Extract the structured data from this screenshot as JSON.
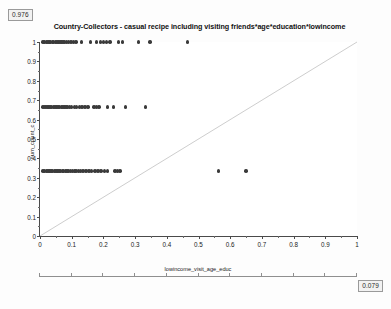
{
  "badges": {
    "top_left": "0.976",
    "bottom_right": "0.079"
  },
  "chart_data": {
    "type": "scatter",
    "title": "Country-Collectors - casual recipe including visiting friends*age*education*lowincome",
    "xlabel": "lowincome_visit_age_educ",
    "ylabel": "num_count_c",
    "xlim": [
      0,
      1
    ],
    "ylim": [
      0,
      1
    ],
    "grid": false,
    "legend": null,
    "xticks": [
      "0",
      "0.1",
      "0.2",
      "0.3",
      "0.4",
      "0.5",
      "0.6",
      "0.7",
      "0.8",
      "0.9",
      "1"
    ],
    "xtick_values": [
      0,
      0.1,
      0.2,
      0.3,
      0.4,
      0.5,
      0.6,
      0.7,
      0.8,
      0.9,
      1
    ],
    "yticks": [
      "1",
      "0.9",
      "0.8",
      "0.7",
      "0.6",
      "0.5",
      "0.4",
      "0.3",
      "0.2",
      "0.1",
      "0"
    ],
    "ytick_values": [
      1,
      0.9,
      0.8,
      0.7,
      0.6,
      0.5,
      0.4,
      0.3,
      0.2,
      0.1,
      0
    ],
    "marker": "filled-circle",
    "marker_color": "#3a3a3a",
    "reference_line": {
      "type": "diagonal",
      "from": [
        0,
        0
      ],
      "to": [
        1,
        1
      ],
      "color": "#4a4a4a"
    },
    "points": [
      [
        0.01,
        1.0
      ],
      [
        0.015,
        1.0
      ],
      [
        0.02,
        1.0
      ],
      [
        0.025,
        1.0
      ],
      [
        0.029,
        1.0
      ],
      [
        0.034,
        1.0
      ],
      [
        0.039,
        1.0
      ],
      [
        0.043,
        1.0
      ],
      [
        0.048,
        1.0
      ],
      [
        0.053,
        1.0
      ],
      [
        0.058,
        1.0
      ],
      [
        0.063,
        1.0
      ],
      [
        0.068,
        1.0
      ],
      [
        0.073,
        1.0
      ],
      [
        0.078,
        1.0
      ],
      [
        0.083,
        1.0
      ],
      [
        0.09,
        1.0
      ],
      [
        0.098,
        1.0
      ],
      [
        0.106,
        1.0
      ],
      [
        0.114,
        1.0
      ],
      [
        0.13,
        1.0
      ],
      [
        0.16,
        1.0
      ],
      [
        0.178,
        1.0
      ],
      [
        0.191,
        1.0
      ],
      [
        0.2,
        1.0
      ],
      [
        0.21,
        1.0
      ],
      [
        0.221,
        1.0
      ],
      [
        0.248,
        1.0
      ],
      [
        0.261,
        1.0
      ],
      [
        0.31,
        1.0
      ],
      [
        0.347,
        1.0
      ],
      [
        0.465,
        1.0
      ],
      [
        0.01,
        0.665
      ],
      [
        0.016,
        0.665
      ],
      [
        0.022,
        0.665
      ],
      [
        0.027,
        0.665
      ],
      [
        0.032,
        0.665
      ],
      [
        0.037,
        0.665
      ],
      [
        0.042,
        0.665
      ],
      [
        0.047,
        0.665
      ],
      [
        0.052,
        0.665
      ],
      [
        0.057,
        0.665
      ],
      [
        0.062,
        0.665
      ],
      [
        0.067,
        0.665
      ],
      [
        0.072,
        0.665
      ],
      [
        0.077,
        0.665
      ],
      [
        0.082,
        0.665
      ],
      [
        0.087,
        0.665
      ],
      [
        0.093,
        0.665
      ],
      [
        0.1,
        0.665
      ],
      [
        0.108,
        0.665
      ],
      [
        0.116,
        0.665
      ],
      [
        0.124,
        0.665
      ],
      [
        0.133,
        0.665
      ],
      [
        0.142,
        0.665
      ],
      [
        0.152,
        0.665
      ],
      [
        0.17,
        0.665
      ],
      [
        0.178,
        0.665
      ],
      [
        0.186,
        0.665
      ],
      [
        0.212,
        0.665
      ],
      [
        0.232,
        0.665
      ],
      [
        0.27,
        0.665
      ],
      [
        0.332,
        0.665
      ],
      [
        0.01,
        0.335
      ],
      [
        0.015,
        0.335
      ],
      [
        0.02,
        0.335
      ],
      [
        0.025,
        0.335
      ],
      [
        0.03,
        0.335
      ],
      [
        0.035,
        0.335
      ],
      [
        0.04,
        0.335
      ],
      [
        0.045,
        0.335
      ],
      [
        0.05,
        0.335
      ],
      [
        0.055,
        0.335
      ],
      [
        0.06,
        0.335
      ],
      [
        0.065,
        0.335
      ],
      [
        0.07,
        0.335
      ],
      [
        0.075,
        0.335
      ],
      [
        0.08,
        0.335
      ],
      [
        0.085,
        0.335
      ],
      [
        0.09,
        0.335
      ],
      [
        0.096,
        0.335
      ],
      [
        0.102,
        0.335
      ],
      [
        0.108,
        0.335
      ],
      [
        0.114,
        0.335
      ],
      [
        0.121,
        0.335
      ],
      [
        0.128,
        0.335
      ],
      [
        0.136,
        0.335
      ],
      [
        0.145,
        0.335
      ],
      [
        0.154,
        0.335
      ],
      [
        0.163,
        0.335
      ],
      [
        0.173,
        0.335
      ],
      [
        0.183,
        0.335
      ],
      [
        0.193,
        0.335
      ],
      [
        0.203,
        0.335
      ],
      [
        0.213,
        0.335
      ],
      [
        0.236,
        0.335
      ],
      [
        0.244,
        0.335
      ],
      [
        0.252,
        0.335
      ],
      [
        0.563,
        0.335
      ],
      [
        0.65,
        0.335
      ]
    ]
  }
}
